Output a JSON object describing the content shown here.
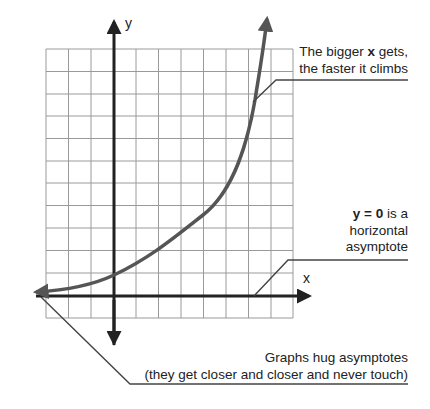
{
  "diagram": {
    "axes": {
      "x_label": "x",
      "y_label": "y"
    },
    "grid": {
      "columns": 11,
      "rows": 12,
      "line_color": "#9a9a9a"
    },
    "colors": {
      "axis": "#222222",
      "curve": "#555555",
      "leader": "#444444",
      "text": "#222222"
    },
    "callouts": [
      {
        "id": "growth",
        "line1_bold": "",
        "line1_pre": "The bigger ",
        "line1_emph": "x",
        "line1_post": " gets,",
        "line2": "the faster it climbs"
      },
      {
        "id": "asymptote",
        "line1_emph": "y = 0",
        "line1_post": " is a",
        "line2": "horizontal",
        "line3": "asymptote"
      },
      {
        "id": "hug",
        "line1": "Graphs hug asymptotes",
        "line2": "(they get closer and closer and never touch)"
      }
    ]
  }
}
